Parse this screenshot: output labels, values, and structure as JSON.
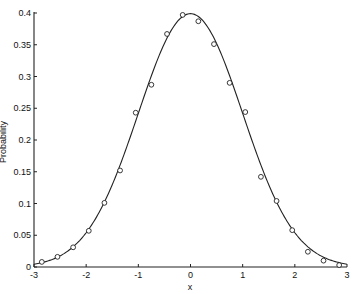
{
  "chart_data": {
    "type": "line",
    "title": "",
    "xlabel": "x",
    "ylabel": "Probability",
    "xlim": [
      -3,
      3
    ],
    "ylim": [
      0,
      0.4
    ],
    "grid": false,
    "legend": null,
    "x_ticks": [
      -3,
      -2,
      -1,
      0,
      1,
      2,
      3
    ],
    "x_tick_labels": [
      "-3",
      "-2",
      "-1",
      "0",
      "1",
      "2",
      "3"
    ],
    "y_ticks": [
      0,
      0.05,
      0.1,
      0.15,
      0.2,
      0.25,
      0.3,
      0.35,
      0.4
    ],
    "y_tick_labels": [
      "0",
      "0.05",
      "0.1",
      "0.15",
      "0.2",
      "0.25",
      "0.3",
      "0.35",
      "0.4"
    ],
    "series": [
      {
        "name": "Normal density curve",
        "kind": "line",
        "function": "standard normal pdf",
        "color": "#222222"
      },
      {
        "name": "Observed points",
        "kind": "scatter",
        "marker": "open-circle",
        "color": "#222222",
        "x": [
          -2.85,
          -2.55,
          -2.25,
          -1.95,
          -1.65,
          -1.35,
          -1.05,
          -0.75,
          -0.45,
          -0.15,
          0.15,
          0.45,
          0.75,
          1.05,
          1.35,
          1.65,
          1.95,
          2.25,
          2.55,
          2.85
        ],
        "y": [
          0.008,
          0.016,
          0.031,
          0.057,
          0.101,
          0.152,
          0.243,
          0.287,
          0.367,
          0.397,
          0.387,
          0.351,
          0.29,
          0.244,
          0.142,
          0.104,
          0.058,
          0.024,
          0.01,
          0.003
        ]
      }
    ]
  }
}
